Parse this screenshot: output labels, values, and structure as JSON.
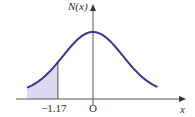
{
  "chart_data": {
    "type": "area",
    "title": "",
    "function": "standard normal density N(x)",
    "ylabel": "N(x)",
    "xlabel": "x",
    "origin_label": "O",
    "xlim": [
      -2.2,
      2.15
    ],
    "mean": 0,
    "std": 1,
    "shaded_region": {
      "from": -2.2,
      "to": -1.17,
      "label": "−1.17"
    },
    "tick_labels": [
      "−1.17",
      "O"
    ],
    "grid": false,
    "colors": {
      "curve": "#3b3494",
      "shade": "#dcdaf0",
      "axis": "#555555"
    }
  }
}
